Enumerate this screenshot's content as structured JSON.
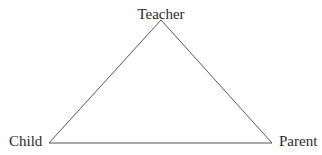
{
  "diagram": {
    "type": "triangle-relationship",
    "nodes": [
      {
        "id": "teacher",
        "label": "Teacher"
      },
      {
        "id": "child",
        "label": "Child"
      },
      {
        "id": "parent",
        "label": "Parent"
      }
    ],
    "edges": [
      {
        "from": "child",
        "to": "teacher"
      },
      {
        "from": "teacher",
        "to": "parent"
      },
      {
        "from": "child",
        "to": "parent"
      }
    ],
    "line_color": "#555555",
    "text_color": "#2a2a2a"
  }
}
